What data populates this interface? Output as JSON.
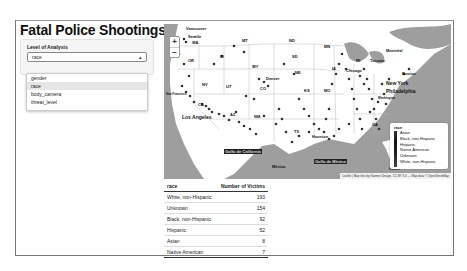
{
  "app": {
    "title": "Fatal Police Shootings"
  },
  "sidebar": {
    "label": "Level of Analysis",
    "select": {
      "value": "race",
      "caret": "▴"
    },
    "dropdown": {
      "options": [
        "gender",
        "race",
        "body_camera",
        "threat_level"
      ],
      "highlighted": "race"
    }
  },
  "map": {
    "zoom_in": "+",
    "zoom_out": "−",
    "labels": {
      "vancouver": "Vancouver",
      "seattle": "Seattle",
      "wa": "WA",
      "or": "OR",
      "mt": "MT",
      "id": "ID",
      "wy": "WY",
      "nd": "ND",
      "sd": "SD",
      "ne": "NE",
      "mn": "MN",
      "ia": "IA",
      "nv": "NV",
      "ut": "UT",
      "co": "CO",
      "denver": "Denver",
      "ks": "KS",
      "mo": "MO",
      "az": "AZ",
      "nm": "NM",
      "tx": "TX",
      "ca": "CA",
      "san_francisco": "San Francisco",
      "los_angeles": "Los Angeles",
      "houston": "Houston",
      "chicago": "Chicago",
      "toronto": "Toronto",
      "montreal": "Montréal",
      "boston": "Boston",
      "new_york": "New York",
      "philadelphia": "Philadelphia",
      "washington": "Washington",
      "mexico": "México",
      "gulf_california": "Golfo de California",
      "gulf_mexico": "Golfo de México",
      "havana": "Havana",
      "ga": "GA",
      "mi": "MI"
    },
    "legend": {
      "title": "race",
      "items": [
        "Asian",
        "Black, non-Hispanic",
        "Hispanic",
        "Native American",
        "Unknown",
        "White, non-Hispanic"
      ]
    },
    "attribution": "Leaflet | Map tiles by Stamen Design, CC BY 3.0 — Map data © OpenStreetMap"
  },
  "table": {
    "headers": [
      "race",
      "Number of Victims"
    ],
    "rows": [
      {
        "label": "White, non-Hispanic",
        "value": "193"
      },
      {
        "label": "Unknown",
        "value": "154"
      },
      {
        "label": "Black, non-Hispanic",
        "value": "92"
      },
      {
        "label": "Hispanic",
        "value": "52"
      },
      {
        "label": "Asian",
        "value": "8"
      },
      {
        "label": "Native American",
        "value": "7"
      }
    ]
  }
}
